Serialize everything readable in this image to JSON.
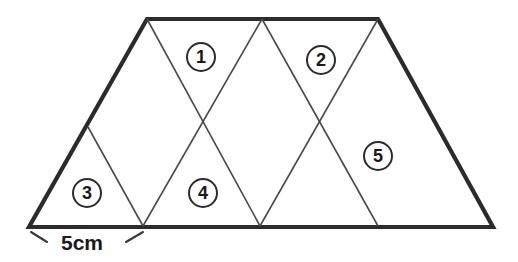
{
  "figure": {
    "background_color": "#ffffff",
    "outline_color": "#2b2b2b",
    "inner_line_color": "#4a4a4a",
    "label_text_color": "#1a1a1a",
    "outline_stroke_width": 4.2,
    "inner_stroke_width": 1.6,
    "outline_points": "147,19 378,19 493,227 29,227",
    "inner_lines": [
      {
        "name": "line-topleft-to-bottom-first",
        "x1": 147,
        "y1": 19,
        "x2": 260,
        "y2": 226
      },
      {
        "name": "line-topmid-to-bottom-left",
        "x1": 262,
        "y1": 19,
        "x2": 143,
        "y2": 226
      },
      {
        "name": "line-topmid-to-bottom-second",
        "x1": 262,
        "y1": 19,
        "x2": 378,
        "y2": 226
      },
      {
        "name": "line-topright-to-bottom-second",
        "x1": 378,
        "y1": 19,
        "x2": 260,
        "y2": 226
      },
      {
        "name": "line-leftedge-to-bottom-left",
        "x1": 88,
        "y1": 127,
        "x2": 143,
        "y2": 226
      }
    ],
    "dimension": {
      "label": "5cm",
      "label_x": 82,
      "label_y": 243,
      "ticks": [
        {
          "name": "dim-tick-left",
          "x1": 31,
          "y1": 232,
          "x2": 47,
          "y2": 242
        },
        {
          "name": "dim-tick-right",
          "x1": 143,
          "y1": 232,
          "x2": 126,
          "y2": 242
        }
      ]
    },
    "region_labels": [
      {
        "name": "region-label-1",
        "text": "①",
        "number": "1",
        "x": 201,
        "y": 57
      },
      {
        "name": "region-label-2",
        "text": "②",
        "number": "2",
        "x": 321,
        "y": 60
      },
      {
        "name": "region-label-3",
        "text": "③",
        "number": "3",
        "x": 87,
        "y": 193
      },
      {
        "name": "region-label-4",
        "text": "④",
        "number": "4",
        "x": 203,
        "y": 193
      },
      {
        "name": "region-label-5",
        "text": "⑤",
        "number": "5",
        "x": 378,
        "y": 156
      }
    ]
  }
}
